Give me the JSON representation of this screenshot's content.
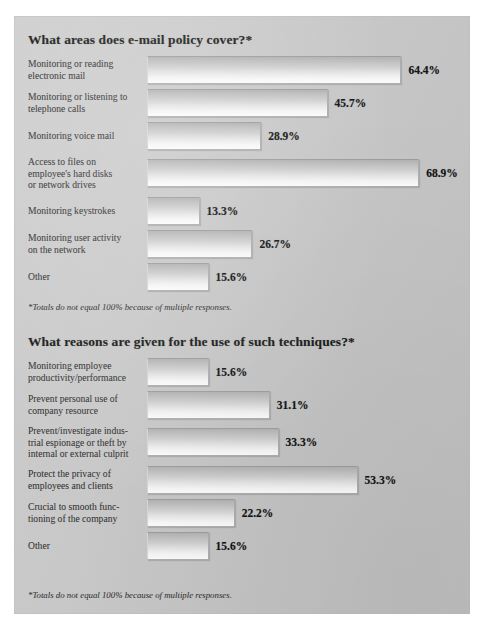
{
  "page": {
    "background_color": "#ffffff",
    "panel_color": "#c8c8c8",
    "bar_fill_top": "#b2b2b2",
    "bar_fill_bottom": "#fbfbfb",
    "text_color": "#3c3c3c",
    "title_color": "#1b1b1b"
  },
  "sections": [
    {
      "title": "What areas does e-mail policy cover?*",
      "footnote": "*Totals do not equal 100% because of multiple responses."
    },
    {
      "title": "What reasons are given for the use of such techniques?*",
      "footnote": "*Totals do not equal 100% because of multiple responses."
    }
  ],
  "chart_data": [
    {
      "type": "bar",
      "orientation": "horizontal",
      "title": "What areas does e-mail policy cover?*",
      "xlabel": "",
      "ylabel": "",
      "xlim": [
        0,
        75
      ],
      "grid": false,
      "legend": "none",
      "value_labels": true,
      "note": "*Totals do not equal 100% because of multiple responses.",
      "categories": [
        "Monitoring or reading electronic mail",
        "Monitoring or listening to telephone calls",
        "Monitoring voice mail",
        "Access to files on employee's hard disks or network drives",
        "Monitoring keystrokes",
        "Monitoring user activity on the network",
        "Other"
      ],
      "category_lines": [
        [
          "Monitoring or reading",
          "electronic mail"
        ],
        [
          "Monitoring or listening to",
          "telephone calls"
        ],
        [
          "Monitoring voice mail"
        ],
        [
          "Access to files on",
          "employee's hard disks",
          "or network drives"
        ],
        [
          "Monitoring keystrokes"
        ],
        [
          "Monitoring user activity",
          "on the network"
        ],
        [
          "Other"
        ]
      ],
      "values": [
        64.4,
        45.7,
        28.9,
        68.9,
        13.3,
        26.7,
        15.6
      ],
      "value_text": [
        "64.4%",
        "45.7%",
        "28.9%",
        "68.9%",
        "13.3%",
        "26.7%",
        "15.6%"
      ]
    },
    {
      "type": "bar",
      "orientation": "horizontal",
      "title": "What reasons are given for the use of such techniques?*",
      "xlabel": "",
      "ylabel": "",
      "xlim": [
        0,
        75
      ],
      "grid": false,
      "legend": "none",
      "value_labels": true,
      "note": "*Totals do not equal 100% because of multiple responses.",
      "categories": [
        "Monitoring employee productivity/performance",
        "Prevent personal use of company resource",
        "Prevent/investigate industrial espionage or theft by internal or external culprit",
        "Protect the privacy of employees and clients",
        "Crucial to smooth functioning of the company",
        "Other"
      ],
      "category_lines": [
        [
          "Monitoring employee",
          "productivity/performance"
        ],
        [
          "Prevent personal use of",
          "company resource"
        ],
        [
          "Prevent/investigate indus-",
          "trial espionage or theft by",
          "internal or external culprit"
        ],
        [
          "Protect the privacy of",
          "employees and clients"
        ],
        [
          "Crucial to smooth func-",
          "tioning of the company"
        ],
        [
          "Other"
        ]
      ],
      "values": [
        15.6,
        31.1,
        33.3,
        53.3,
        22.2,
        15.6
      ],
      "value_text": [
        "15.6%",
        "31.1%",
        "33.3%",
        "53.3%",
        "22.2%",
        "15.6%"
      ]
    }
  ]
}
